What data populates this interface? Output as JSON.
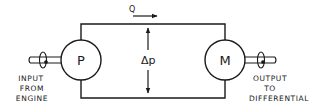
{
  "diagram": {
    "flow_label": "Q",
    "pressure_label": "Δp",
    "pump": {
      "symbol": "P"
    },
    "motor": {
      "symbol": "M"
    },
    "input": {
      "lines": [
        "INPUT",
        "FROM",
        "ENGINE"
      ]
    },
    "output": {
      "lines": [
        "OUTPUT",
        "TO",
        "DIFFERENTIAL"
      ]
    },
    "colors": {
      "stroke": "#1a1a1a",
      "background": "#ffffff"
    }
  }
}
